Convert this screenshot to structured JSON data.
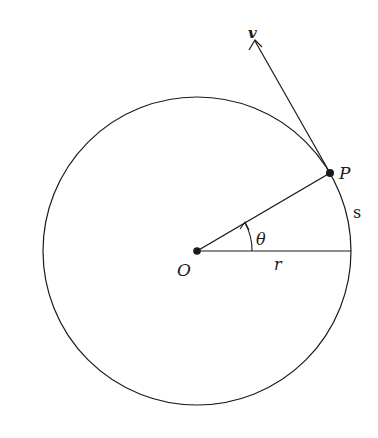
{
  "diagram": {
    "labels": {
      "velocity": "v",
      "point": "P",
      "origin": "O",
      "radius": "r",
      "angle": "θ",
      "arc": "s"
    },
    "geometry": {
      "center": [
        197,
        251
      ],
      "radius": 154,
      "point_p": [
        330,
        173
      ],
      "velocity_tip": [
        255,
        40
      ]
    },
    "colors": {
      "stroke": "#1a1a1a",
      "background": "#ffffff"
    }
  }
}
